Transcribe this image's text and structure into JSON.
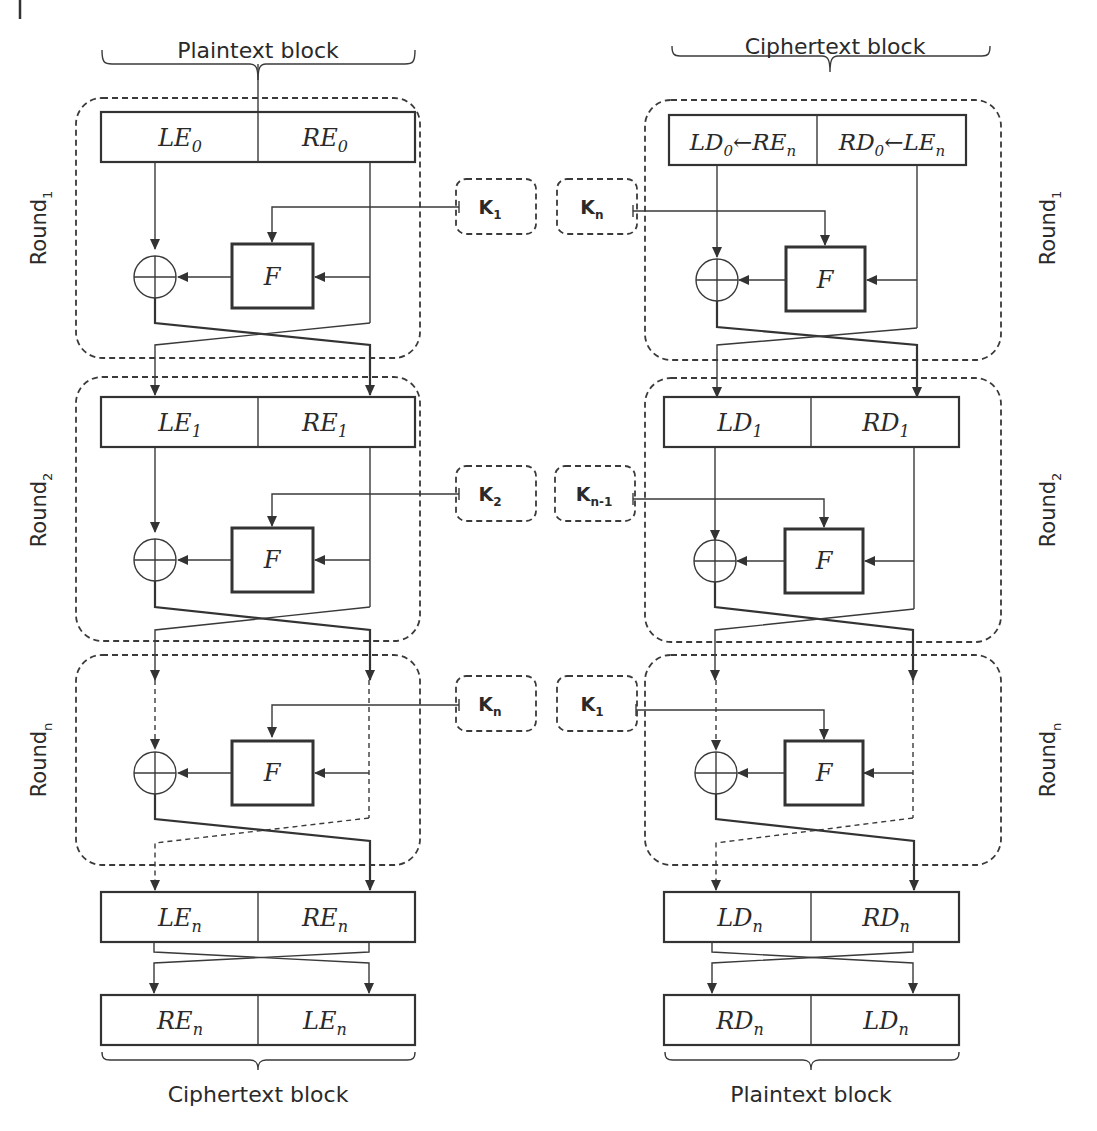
{
  "diagram": {
    "encryption": {
      "top_label": "Plaintext block",
      "bottom_label": "Ciphertext block",
      "rounds": [
        {
          "label": "Round",
          "sub": "1",
          "left": "LE",
          "left_sub": "0",
          "right": "RE",
          "right_sub": "0",
          "key": "K",
          "key_sub": "1",
          "function": "F"
        },
        {
          "label": "Round",
          "sub": "2",
          "left": "LE",
          "left_sub": "1",
          "right": "RE",
          "right_sub": "1",
          "key": "K",
          "key_sub": "2",
          "function": "F"
        },
        {
          "label": "Round",
          "sub": "n",
          "key": "K",
          "key_sub": "n",
          "function": "F"
        }
      ],
      "output": {
        "left": "LE",
        "left_sub": "n",
        "right": "RE",
        "right_sub": "n"
      },
      "swapped": {
        "left": "RE",
        "left_sub": "n",
        "right": "LE",
        "right_sub": "n"
      }
    },
    "decryption": {
      "top_label": "Ciphertext block",
      "bottom_label": "Plaintext block",
      "rounds": [
        {
          "label": "Round",
          "sub": "1",
          "left": "LD",
          "left_sub": "0",
          "left_assign": "←RE",
          "left_assign_sub": "n",
          "right": "RD",
          "right_sub": "0",
          "right_assign": "←LE",
          "right_assign_sub": "n",
          "key": "K",
          "key_sub": "n",
          "function": "F"
        },
        {
          "label": "Round",
          "sub": "2",
          "left": "LD",
          "left_sub": "1",
          "right": "RD",
          "right_sub": "1",
          "key": "K",
          "key_sub": "n-1",
          "function": "F"
        },
        {
          "label": "Round",
          "sub": "n",
          "key": "K",
          "key_sub": "1",
          "function": "F"
        }
      ],
      "output": {
        "left": "LD",
        "left_sub": "n",
        "right": "RD",
        "right_sub": "n"
      },
      "swapped": {
        "left": "RD",
        "left_sub": "n",
        "right": "LD",
        "right_sub": "n"
      }
    },
    "symbols": {
      "xor": "xor-icon",
      "arrow": "arrowhead-icon"
    }
  }
}
